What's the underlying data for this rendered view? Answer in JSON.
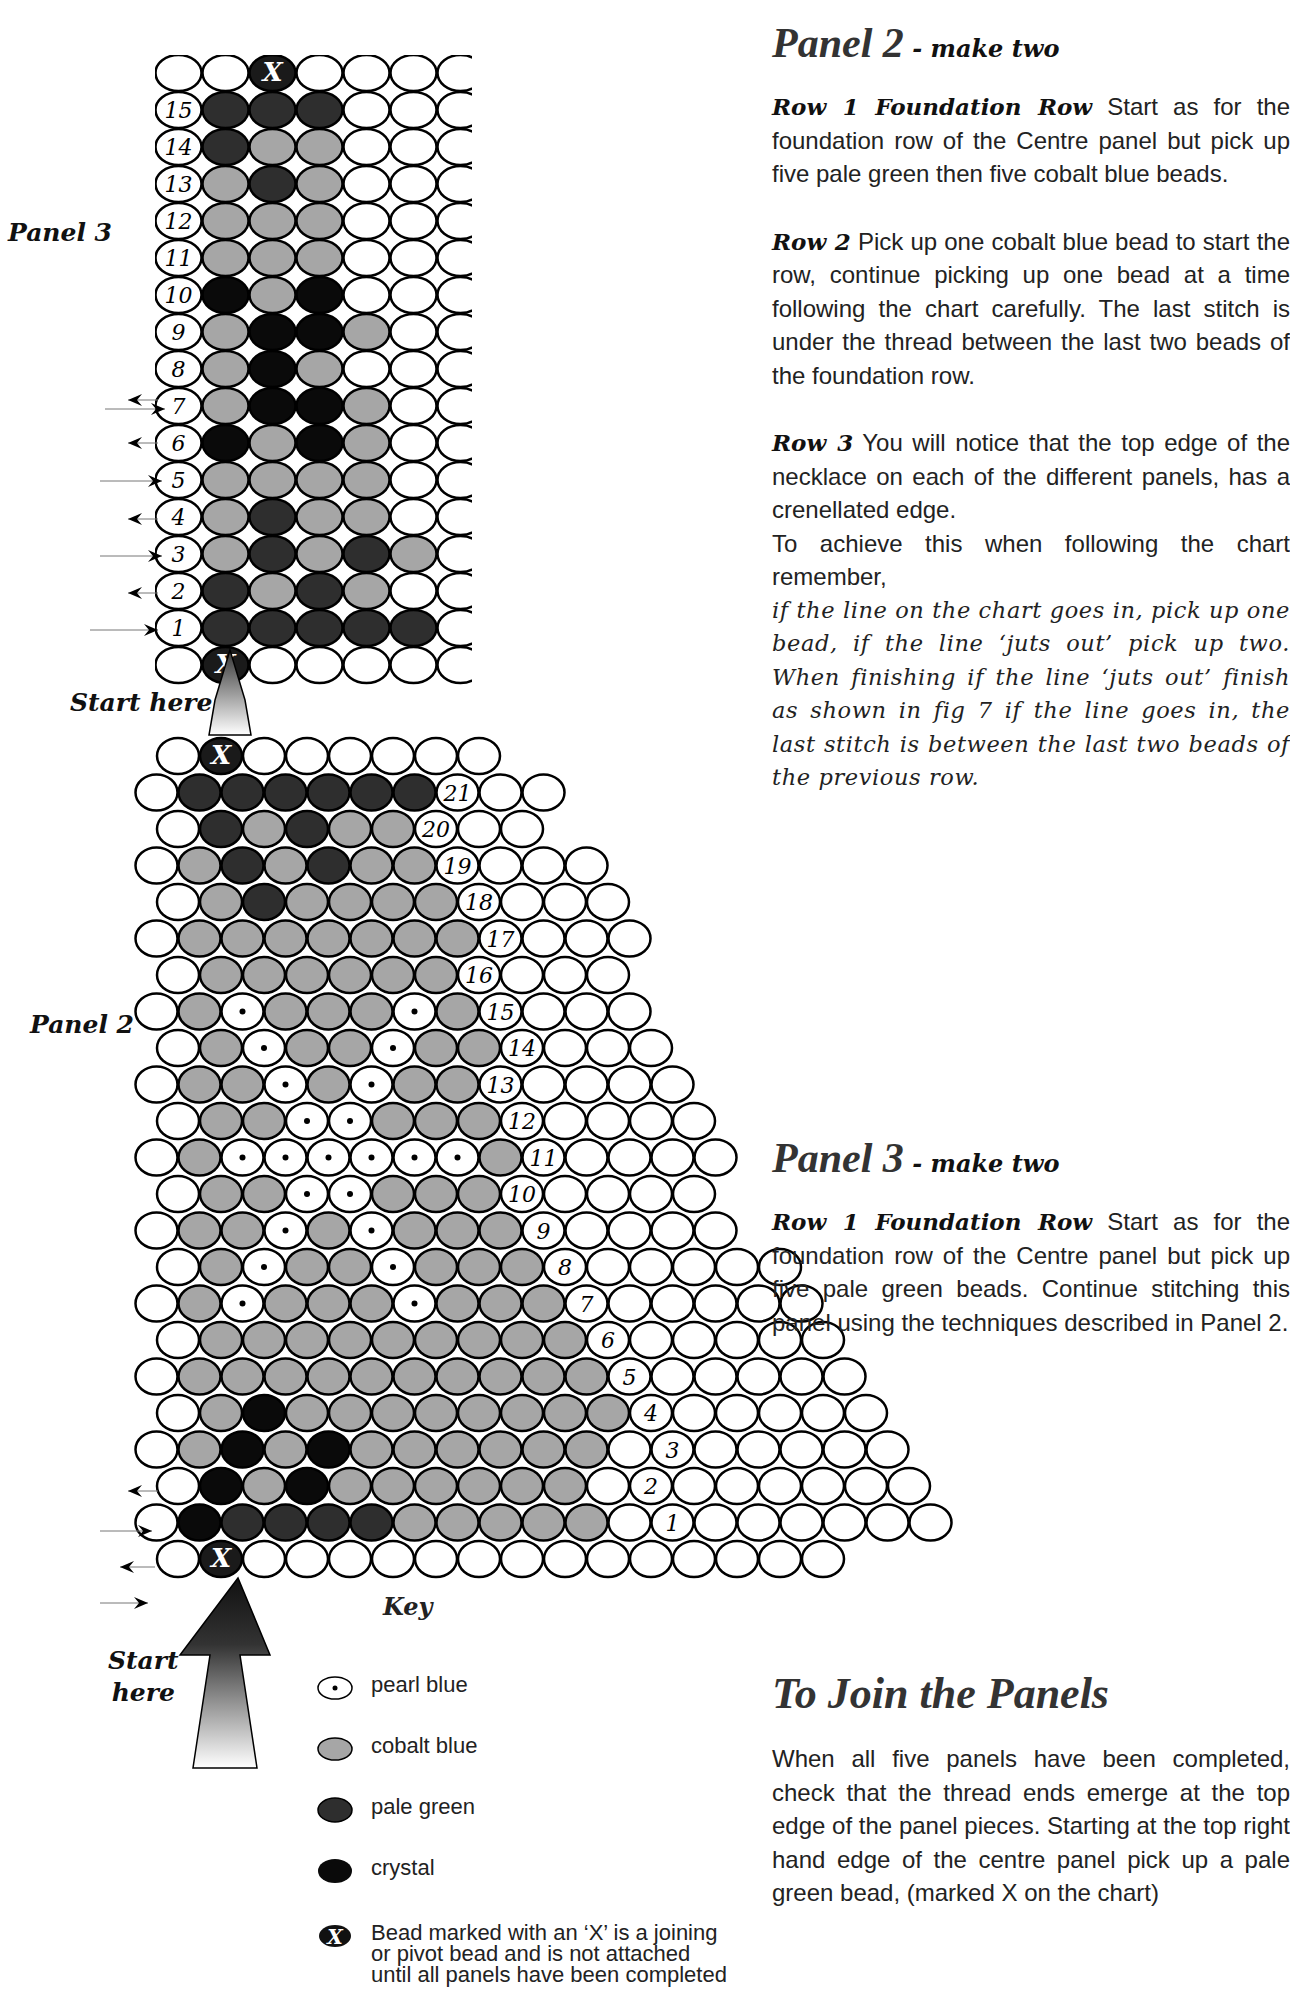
{
  "page": {
    "domain": "bead-pattern-instructions",
    "page_number_partial": "16"
  },
  "colors": {
    "white_bead": "#ffffff",
    "cobalt_blue": "#a6a6a6",
    "pale_green": "#2e2e2e",
    "crystal": "#0a0a0a",
    "pearl_blue": "#ffffff",
    "outline": "#000000"
  },
  "labels": {
    "panel3": "Panel 3",
    "panel2": "Panel 2",
    "start_here_top": "Start here",
    "start_here_bottom_line1": "Start",
    "start_here_bottom_line2": "here"
  },
  "key": {
    "title": "Key",
    "items": [
      {
        "symbol": "pearl",
        "label": "pearl blue"
      },
      {
        "symbol": "cobalt",
        "label": "cobalt blue"
      },
      {
        "symbol": "green",
        "label": "pale green"
      },
      {
        "symbol": "crystal",
        "label": "crystal"
      },
      {
        "symbol": "x",
        "label": "Bead marked with an ‘X’ is a joining or pivot bead and is not attached until all panels have been completed"
      }
    ]
  },
  "text": {
    "panel2": {
      "title": "Panel 2",
      "subtitle": " - make two",
      "row1_lead": "Row 1 Foundation Row",
      "row1_body": "  Start as for the foundation row of the Centre panel but pick up five pale green then five cobalt blue beads.",
      "row2_lead": "Row 2",
      "row2_body": " Pick up one cobalt blue bead to start the row, continue picking up one bead at a time following the chart carefully. The last stitch is under the thread between the last two beads of the foundation row.",
      "row3_lead": "Row 3",
      "row3_body": "  You will notice that the top edge of the necklace on each of the different panels, has a crenellated edge.",
      "row3_body2": "To achieve this when following the chart remember,",
      "row3_italic": "if the line on the chart goes in, pick up one bead, if the line ‘juts out’ pick up two. When finishing if the line ‘juts out’ finish as shown in fig 7 if the line goes in, the last stitch is between the last two beads of the previous row."
    },
    "panel3": {
      "title": "Panel 3",
      "subtitle": " - make two",
      "row1_lead": "Row 1 Foundation Row",
      "row1_body": "  Start as for the foundation row of the Centre panel but pick up five pale green beads. Continue stitching this panel using the techniques described in Panel 2."
    },
    "join": {
      "title": "To Join the Panels",
      "body": "When all five panels have been completed, check that the thread ends emerge at the top edge of the panel pieces. Starting at the top right hand edge of the centre panel pick up a pale green bead, (marked X on the chart)"
    }
  },
  "chart_data": [
    {
      "type": "table",
      "title": "Panel 3",
      "legend": {
        "w": "empty/outline",
        "c": "cobalt blue",
        "g": "pale green",
        "k": "crystal",
        "p": "pearl blue",
        "x": "X joining bead",
        "n": "row number"
      },
      "rows_top_to_bottom": [
        {
          "row": "top",
          "beads": "wwxwwww"
        },
        {
          "row": 15,
          "beads": "ggg www"
        },
        {
          "row": 14,
          "beads": "gcc ww"
        },
        {
          "row": 13,
          "beads": "cgc www"
        },
        {
          "row": 12,
          "beads": "ccc ww"
        },
        {
          "row": 11,
          "beads": "ccc www"
        },
        {
          "row": 10,
          "beads": "kck ww"
        },
        {
          "row": 9,
          "beads": "ckkc ww"
        },
        {
          "row": 8,
          "beads": "ckc ww"
        },
        {
          "row": 7,
          "beads": "ckkc ww"
        },
        {
          "row": 6,
          "beads": "kckc w"
        },
        {
          "row": 5,
          "beads": "cccc ww"
        },
        {
          "row": 4,
          "beads": "cgcc w"
        },
        {
          "row": 3,
          "beads": "cgcgc w"
        },
        {
          "row": 2,
          "beads": "gcgc w"
        },
        {
          "row": 1,
          "beads": "ggggg w"
        },
        {
          "row": "bottom",
          "beads": "wxwwww"
        }
      ]
    },
    {
      "type": "table",
      "title": "Panel 2",
      "rows_top_to_bottom": [
        {
          "row": "top",
          "beads": "wxwwwwww"
        },
        {
          "row": 21,
          "beads": "wgggggg"
        },
        {
          "row": 20,
          "beads": "wgcgcc"
        },
        {
          "row": 19,
          "beads": "wcgcgcc"
        },
        {
          "row": 18,
          "beads": "wcgcccc"
        },
        {
          "row": 17,
          "beads": "wccccccc"
        },
        {
          "row": 16,
          "beads": "wcccccc"
        },
        {
          "row": 15,
          "beads": "wcpcccpc"
        },
        {
          "row": 14,
          "beads": "wcpccpcc"
        },
        {
          "row": 13,
          "beads": "wccpcpcc"
        },
        {
          "row": 12,
          "beads": "wccppccc"
        },
        {
          "row": 11,
          "beads": "wcppppppc"
        },
        {
          "row": 10,
          "beads": "wccppccc"
        },
        {
          "row": 9,
          "beads": "wccpcpccc"
        },
        {
          "row": 8,
          "beads": "wcpccpccc"
        },
        {
          "row": 7,
          "beads": "wcpcccpccc"
        },
        {
          "row": 6,
          "beads": "wccccccccc"
        },
        {
          "row": 5,
          "beads": "wcccccccccc"
        },
        {
          "row": 4,
          "beads": "wckcccccccc"
        },
        {
          "row": 3,
          "beads": "wckckccccccw"
        },
        {
          "row": 2,
          "beads": "wkckccccccw"
        },
        {
          "row": 1,
          "beads": "wkggggcccccw"
        },
        {
          "row": "bottom",
          "beads": "wxwwwwwwwwwwwwww"
        }
      ]
    }
  ]
}
